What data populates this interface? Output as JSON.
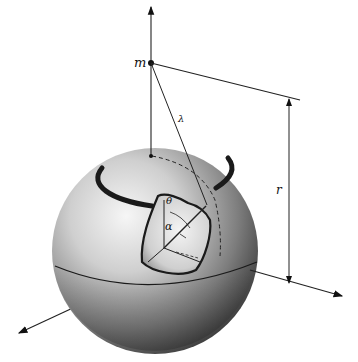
{
  "diagram": {
    "labels": {
      "mass": "m",
      "distance": "r",
      "lambda": "λ",
      "theta": "θ",
      "alpha": "α"
    },
    "colors": {
      "ink": "#111111",
      "sphere_light": "#f2f2f2",
      "sphere_mid": "#9a9a9a",
      "sphere_dark": "#2e2e2e",
      "background": "#ffffff"
    }
  }
}
